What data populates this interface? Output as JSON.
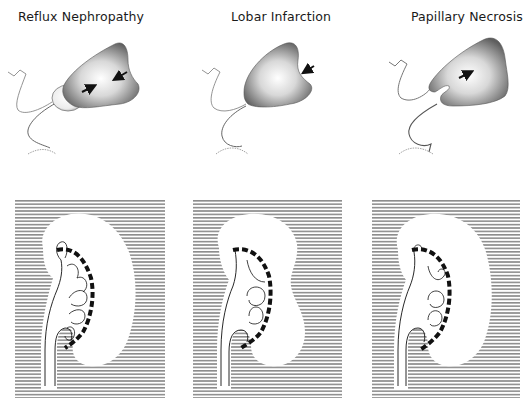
{
  "figure": {
    "columns": [
      {
        "id": "reflux",
        "title": "Reflux Nephropathy",
        "arrows_count": 2,
        "description": "Scarred kidney with clubbed, blunted calyces extending beyond the papillary line"
      },
      {
        "id": "lobar",
        "title": "Lobar Infarction",
        "arrows_count": 1,
        "description": "Focal cortical indentation with normal calyces"
      },
      {
        "id": "papillary",
        "title": "Papillary Necrosis",
        "arrows_count": 1,
        "description": "Sloughed papilla with irregular calyceal tips"
      }
    ],
    "colors": {
      "background": "#ffffff",
      "hatch": "#8c8c8c",
      "kidney_shade_dark": "#5a5a5a",
      "kidney_shade_light": "#f2f2f2",
      "ink": "#111111"
    }
  }
}
